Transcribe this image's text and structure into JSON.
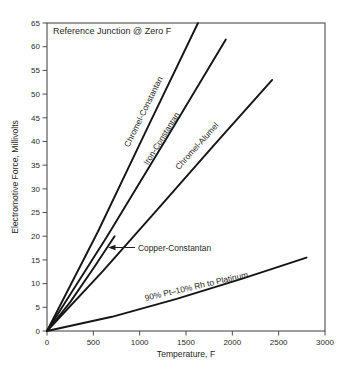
{
  "chart_data": {
    "type": "line",
    "annotation": "Reference Junction @ Zero F",
    "xlabel": "Temperature, F",
    "ylabel": "Electromotive Force, Millivolts",
    "xlim": [
      0,
      3000
    ],
    "ylim": [
      0,
      65
    ],
    "grid": false,
    "legend_position": "labels-on-lines",
    "x_ticks": [
      0,
      500,
      1000,
      1500,
      2000,
      2500,
      3000
    ],
    "y_ticks": [
      0,
      5,
      10,
      15,
      20,
      25,
      30,
      35,
      40,
      45,
      50,
      55,
      60,
      65
    ],
    "series": [
      {
        "name": "Chromel-Constantan",
        "x": [
          0,
          550,
          1100,
          1630
        ],
        "y": [
          0,
          21,
          43.5,
          65
        ]
      },
      {
        "name": "Iron-Constantan",
        "x": [
          0,
          650,
          1300,
          1930
        ],
        "y": [
          0,
          20,
          41,
          61.5
        ]
      },
      {
        "name": "Chromel-Alumel",
        "x": [
          0,
          600,
          1200,
          1800,
          2430
        ],
        "y": [
          0,
          12.6,
          25.8,
          39.2,
          53
        ]
      },
      {
        "name": "Copper-Constantan",
        "x": [
          0,
          250,
          500,
          730
        ],
        "y": [
          0,
          6.1,
          13.2,
          20
        ]
      },
      {
        "name": "90% Pt–10% Rh to Platinum",
        "x": [
          0,
          700,
          1400,
          2100,
          2800
        ],
        "y": [
          0,
          3,
          6.8,
          11,
          15.5
        ]
      }
    ],
    "line_color": "#151515"
  }
}
